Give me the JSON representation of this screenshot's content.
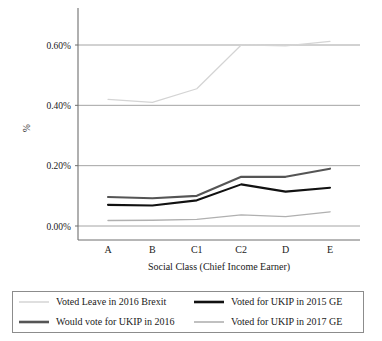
{
  "chart_data": {
    "type": "line",
    "title": "",
    "xlabel": "Social Class (Chief Income Earner)",
    "ylabel": "%",
    "categories": [
      "A",
      "B",
      "C1",
      "C2",
      "D",
      "E"
    ],
    "ylim": [
      0.0,
      0.7
    ],
    "ytick_values": [
      0.0,
      0.2,
      0.4,
      0.6
    ],
    "ytick_labels": [
      "0.00%",
      "0.20%",
      "0.40%",
      "0.60%"
    ],
    "grid": true,
    "legend_position": "below",
    "series": [
      {
        "name": "Voted Leave in 2016 Brexit",
        "color": "#d4d4d4",
        "width": 1.2,
        "values": [
          0.42,
          0.41,
          0.455,
          0.6,
          0.597,
          0.612
        ]
      },
      {
        "name": "Voted for UKIP in 2015 GE",
        "color": "#111111",
        "width": 2.1,
        "values": [
          0.07,
          0.068,
          0.085,
          0.138,
          0.114,
          0.127
        ]
      },
      {
        "name": "Would vote for UKIP in 2016",
        "color": "#555555",
        "width": 2.1,
        "values": [
          0.096,
          0.092,
          0.1,
          0.163,
          0.163,
          0.19
        ]
      },
      {
        "name": "Voted for UKIP in 2017 GE",
        "color": "#b0b0b0",
        "width": 1.4,
        "values": [
          0.018,
          0.019,
          0.022,
          0.037,
          0.031,
          0.047
        ]
      }
    ]
  },
  "axes": {
    "y_title": "%",
    "x_title": "Social Class (Chief Income Earner)",
    "ytick_labels": [
      "0.60%",
      "0.40%",
      "0.20%",
      "0.00%"
    ],
    "xtick_labels": [
      "A",
      "B",
      "C1",
      "C2",
      "D",
      "E"
    ]
  },
  "legend": {
    "items": [
      {
        "label": "Voted Leave in 2016 Brexit",
        "color": "#d4d4d4",
        "thickness": 1.5
      },
      {
        "label": "Voted for UKIP in 2015 GE",
        "color": "#111111",
        "thickness": 2.6
      },
      {
        "label": "Would vote for UKIP in 2016",
        "color": "#555555",
        "thickness": 2.6
      },
      {
        "label": "Voted for UKIP in 2017 GE",
        "color": "#b0b0b0",
        "thickness": 1.6
      }
    ]
  },
  "colors": {
    "gridline": "#9a9a9a",
    "axis": "#6f6f6f",
    "text": "#1a1a1a",
    "legend_border": "#8c8c8c",
    "background": "#ffffff"
  }
}
